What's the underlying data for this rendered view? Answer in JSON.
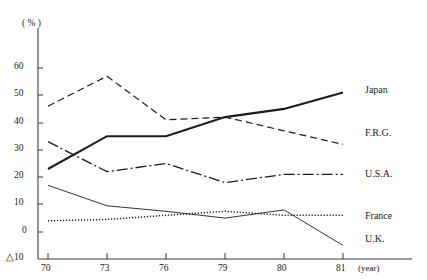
{
  "chart_data": {
    "type": "line",
    "title": "",
    "subtitle": "",
    "xlabel": "(year)",
    "ylabel": "( % )",
    "x": [
      70,
      73,
      76,
      79,
      80,
      81
    ],
    "categories": [
      "70",
      "73",
      "76",
      "79",
      "80",
      "81"
    ],
    "xlim": [
      70,
      81
    ],
    "ylim": [
      -10,
      65
    ],
    "yticks": [
      -10,
      0,
      10,
      20,
      30,
      40,
      50,
      60
    ],
    "ytick_labels": [
      "△10",
      "0",
      "10",
      "20",
      "30",
      "40",
      "50",
      "60"
    ],
    "grid": false,
    "legend_position": "right-inline",
    "series": [
      {
        "name": "Japan",
        "style": "solid-thick",
        "values": [
          23,
          35,
          35,
          42,
          45,
          51
        ]
      },
      {
        "name": "F.R.G.",
        "style": "dashed",
        "values": [
          46,
          57,
          41,
          42,
          37,
          32
        ]
      },
      {
        "name": "U.S.A.",
        "style": "dash-dot",
        "values": [
          33,
          22,
          25,
          18,
          21,
          21
        ]
      },
      {
        "name": "France",
        "style": "dotted",
        "values": [
          4,
          4.5,
          6,
          7.5,
          6,
          6
        ]
      },
      {
        "name": "U.K.",
        "style": "solid-thin",
        "values": [
          17,
          9.5,
          7.5,
          5,
          8,
          -5
        ]
      }
    ]
  },
  "axis": {
    "unit_label": "( % )",
    "year_label": "(year)"
  },
  "labels": {
    "japan": "Japan",
    "frg": "F.R.G.",
    "usa": "U.S.A.",
    "france": "France",
    "uk": "U.K."
  }
}
